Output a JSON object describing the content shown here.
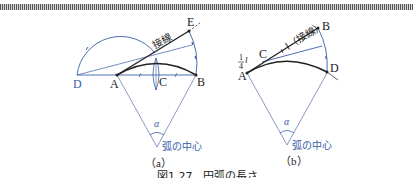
{
  "figure": {
    "caption": "図1.27　円弧の長さ",
    "colors": {
      "black": "#222222",
      "blue": "#3a5ea8",
      "thin": "#6b7fb0"
    }
  },
  "panel_a": {
    "sublabel": "（a）",
    "points": {
      "D": "D",
      "A": "A",
      "C": "C",
      "B": "B",
      "E": "E"
    },
    "tangent_label": "接線",
    "angle_label": "α",
    "center_label": "弧の中心"
  },
  "panel_b": {
    "sublabel": "（b）",
    "points": {
      "A": "A",
      "C": "C",
      "B": "B",
      "D": "D"
    },
    "quarter_num": "1",
    "quarter_den": "4",
    "quarter_var": "l",
    "tangent_label": "l（接線）",
    "angle_label": "α",
    "center_label": "弧の中心"
  }
}
